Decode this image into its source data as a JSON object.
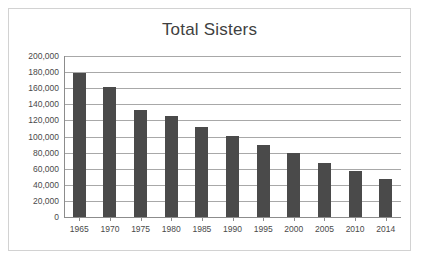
{
  "chart_data": {
    "type": "bar",
    "title": "Total Sisters",
    "xlabel": "",
    "ylabel": "",
    "categories": [
      "1965",
      "1970",
      "1975",
      "1980",
      "1985",
      "1990",
      "1995",
      "2000",
      "2005",
      "2010",
      "2014"
    ],
    "values": [
      179000,
      161000,
      133000,
      125000,
      112000,
      101000,
      89000,
      80000,
      67000,
      57000,
      47000
    ],
    "ylim": [
      0,
      200000
    ],
    "ytick_step": 20000,
    "ytick_labels": [
      "200,000",
      "180,000",
      "160,000",
      "140,000",
      "120,000",
      "100,000",
      "80,000",
      "60,000",
      "40,000",
      "20,000",
      "0"
    ],
    "ytick_values": [
      200000,
      180000,
      160000,
      140000,
      120000,
      100000,
      80000,
      60000,
      40000,
      20000,
      0
    ],
    "grid": true,
    "legend": false,
    "series_color": "#4a4a4a",
    "gridline_color": "#a8a8a8",
    "axis_color": "#8c8c8c",
    "frame_color": "#d2d2d2",
    "background": "#ffffff"
  }
}
